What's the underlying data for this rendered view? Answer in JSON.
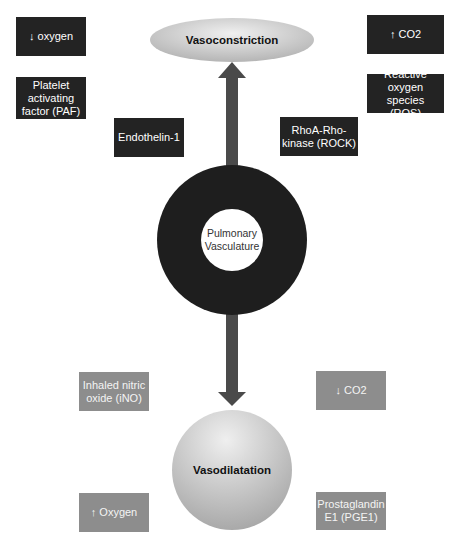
{
  "diagram": {
    "top_node": "Vasoconstriction",
    "center_node": "Pulmonary\nVasculature",
    "bottom_node": "Vasodilatation",
    "vasoconstriction_factors": [
      {
        "label": "↓ oxygen"
      },
      {
        "label": "Platelet\nactivating\nfactor (PAF)"
      },
      {
        "label": "Endothelin-1"
      },
      {
        "label": "↑ CO2"
      },
      {
        "label": "Reactive\noxygen species\n(ROS)"
      },
      {
        "label": "RhoA-Rho-\nkinase (ROCK)"
      }
    ],
    "vasodilatation_factors": [
      {
        "label": "Inhaled nitric\noxide (iNO)"
      },
      {
        "label": "↓ CO2"
      },
      {
        "label": "↑ Oxygen"
      },
      {
        "label": "Prostaglandin\nE1 (PGE1)"
      }
    ],
    "colors": {
      "constriction_box": "#232323",
      "dilatation_box": "#8d8d8d",
      "arrow": "#4a4a4a",
      "ring": "#1e1e1e"
    }
  }
}
